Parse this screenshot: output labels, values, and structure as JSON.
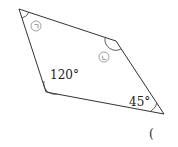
{
  "figure": {
    "shape": "quadrilateral",
    "vertices": {
      "top_left": [
        19,
        9
      ],
      "right": [
        116,
        41
      ],
      "bottom_right": [
        164,
        114
      ],
      "bottom_left": [
        46,
        92
      ]
    },
    "angles": {
      "top_left": {
        "label": "ㄱ",
        "marker": "circled"
      },
      "right": {
        "label": "ㄴ",
        "marker": "circled"
      },
      "bottom_left": {
        "label": "120°",
        "value": 120
      },
      "bottom_right": {
        "label": "45°",
        "value": 45
      }
    },
    "answer_paren": "("
  },
  "colors": {
    "line": "#333333",
    "circle": "#888888"
  }
}
